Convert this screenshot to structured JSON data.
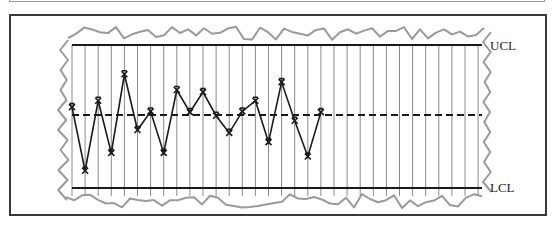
{
  "chart_data": {
    "type": "line",
    "title": "",
    "subtitle": "Control chart",
    "xlabel": "",
    "ylabel": "",
    "grid": true,
    "legend": null,
    "control_limits": {
      "upper_label": "UCL",
      "lower_label": "LCL",
      "center_line": "dashed"
    },
    "ylim_pixels_note": "values expressed as relative position: UCL = 1.0, center = 0.0, LCL = -1.0",
    "x": [
      1,
      2,
      3,
      4,
      5,
      6,
      7,
      8,
      9,
      10,
      11,
      12,
      13,
      14,
      15,
      16,
      17,
      18,
      19,
      20
    ],
    "values": [
      0.11,
      -0.78,
      0.2,
      -0.53,
      0.57,
      -0.21,
      0.05,
      -0.53,
      0.35,
      0.04,
      0.32,
      -0.01,
      -0.25,
      0.05,
      0.2,
      -0.38,
      0.46,
      -0.08,
      -0.58,
      0.04
    ],
    "marker": "x",
    "num_grid_columns": 32,
    "annotations": [
      "UCL",
      "LCL"
    ]
  },
  "labels": {
    "ucl": "UCL",
    "lcl": "LCL"
  },
  "colors": {
    "frame": "#3a3a3a",
    "grid": "#8a8a8a",
    "limit_line": "#1a1a1a",
    "data_line": "#1a1a1a",
    "torn_edge": "#9a9a9a"
  }
}
